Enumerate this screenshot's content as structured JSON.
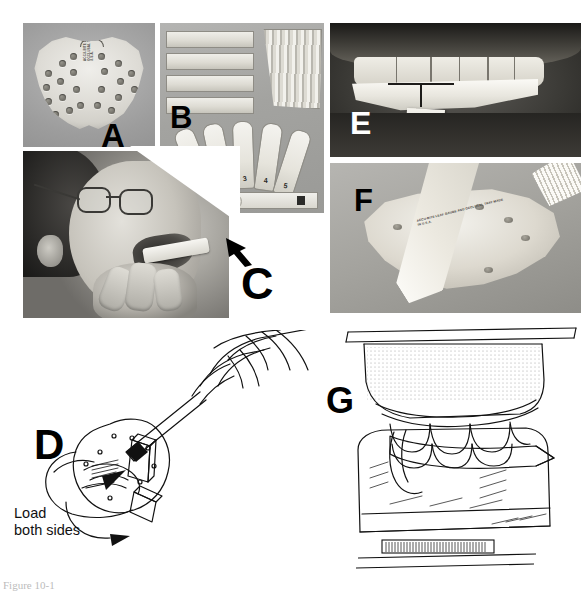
{
  "figure": {
    "caption": "Figure 10-1",
    "panel_count": 7,
    "background_color": "#ffffff"
  },
  "panels": [
    {
      "id": "A",
      "label": "A",
      "label_color": "#000000",
      "type": "photograph",
      "description": "Perforated maxillary registration tray, occlusal view",
      "imprint_text": "ACCU-BITE LEAF GAUGE AND OCCLUSAL TRAY MADE IN U.S.A.",
      "hole_count": 22,
      "background_color": "#a0a09d"
    },
    {
      "id": "B",
      "label": "B",
      "label_color": "#000000",
      "type": "photograph",
      "description": "Wax wafer strips, fanned leaf gauge stack and numbered registration sticks",
      "wafer_strip_count": 4,
      "stick_numbers": [
        "1",
        "2",
        "3",
        "4",
        "5"
      ],
      "background_color": "#a6a6a3"
    },
    {
      "id": "C",
      "label": "C",
      "label_color": "#000000",
      "type": "photograph",
      "description": "Patient seated, clinician positioning tray intraorally; arrow indicates insertion direction",
      "annotation_icon": "arrow-up-left",
      "background_color": "#9b9994"
    },
    {
      "id": "D",
      "label": "D",
      "label_color": "#000000",
      "type": "line-drawing",
      "description": "Hand loading wax onto both sides of the tray",
      "annotations": [
        {
          "text": "Load",
          "line": 1
        },
        {
          "text": "both sides",
          "line": 2
        }
      ],
      "arrow_count": 2,
      "background_color": "#ffffff"
    },
    {
      "id": "E",
      "label": "E",
      "label_color": "#ffffff",
      "type": "photograph",
      "description": "Intraoral close-up, anterior view of tray seated against maxillary teeth with midline reference lines",
      "background_color": "#2e2d2a"
    },
    {
      "id": "F",
      "label": "F",
      "label_color": "#000000",
      "type": "photograph",
      "description": "Tray with stacked wax wafers resting on perforated cast",
      "imprint_text": "ACCU-BITE LEAF GAUGE AND OCCLUSAL TRAY MADE IN U.S.A.",
      "background_color": "#a4a39f"
    },
    {
      "id": "G",
      "label": "G",
      "label_color": "#000000",
      "type": "line-drawing",
      "description": "Sectional drawing of mounted casts in occlusion with registration material interposed; graduated scale bar below",
      "scale_bar": {
        "present": true,
        "tick_count": 34
      },
      "background_color": "#ffffff"
    }
  ],
  "colors": {
    "ink": "#000000",
    "paper": "#ffffff",
    "photo_gray": "#a0a09d",
    "photo_dark": "#2e2d2a"
  }
}
